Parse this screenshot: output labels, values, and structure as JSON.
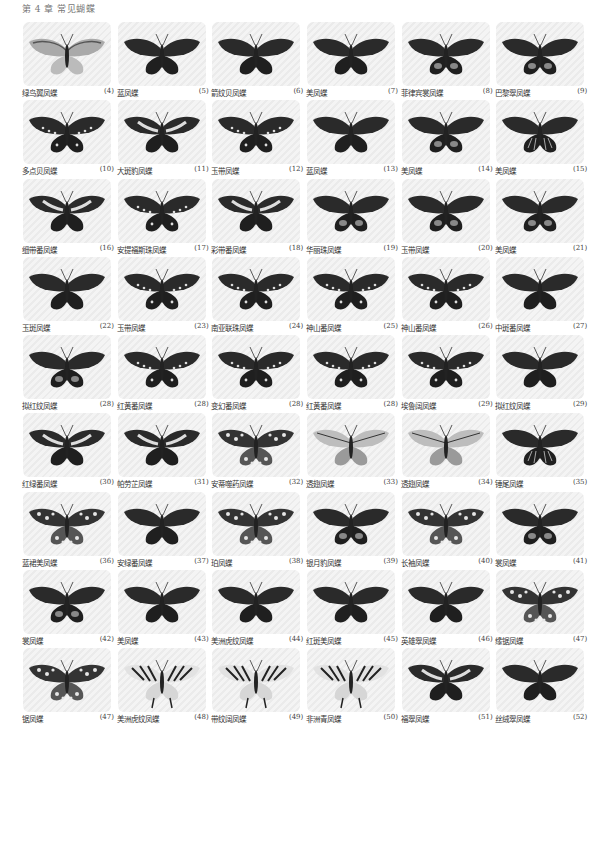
{
  "header": {
    "title": "第 4 章 常见蝴蝶"
  },
  "butterflies": [
    {
      "name": "绿鸟翼凤蝶",
      "num": "(4)",
      "style": "birdwing"
    },
    {
      "name": "蓝凤蝶",
      "num": "(5)",
      "style": "dark"
    },
    {
      "name": "箭纹贝凤蝶",
      "num": "(6)",
      "style": "dark"
    },
    {
      "name": "美凤蝶",
      "num": "(7)",
      "style": "dark"
    },
    {
      "name": "菲律宾裳凤蝶",
      "num": "(8)",
      "style": "darkspot"
    },
    {
      "name": "巴黎翠凤蝶",
      "num": "(9)",
      "style": "darkspot"
    },
    {
      "name": "多点贝凤蝶",
      "num": "(10)",
      "style": "dots"
    },
    {
      "name": "大斑豹凤蝶",
      "num": "(11)",
      "style": "band"
    },
    {
      "name": "玉带凤蝶",
      "num": "(12)",
      "style": "dots"
    },
    {
      "name": "蓝凤蝶",
      "num": "(13)",
      "style": "dark"
    },
    {
      "name": "美凤蝶",
      "num": "(14)",
      "style": "darkspot"
    },
    {
      "name": "美凤蝶",
      "num": "(15)",
      "style": "stripe"
    },
    {
      "name": "细带番凤蝶",
      "num": "(16)",
      "style": "band"
    },
    {
      "name": "安提福斯珠凤蝶",
      "num": "(17)",
      "style": "dots"
    },
    {
      "name": "彩带番凤蝶",
      "num": "(18)",
      "style": "band"
    },
    {
      "name": "华丽珠凤蝶",
      "num": "(19)",
      "style": "darkspot"
    },
    {
      "name": "玉带凤蝶",
      "num": "(20)",
      "style": "darkspot"
    },
    {
      "name": "美凤蝶",
      "num": "(21)",
      "style": "darkspot"
    },
    {
      "name": "玉斑凤蝶",
      "num": "(22)",
      "style": "dark"
    },
    {
      "name": "玉带凤蝶",
      "num": "(23)",
      "style": "dots"
    },
    {
      "name": "南亚联珠凤蝶",
      "num": "(24)",
      "style": "dots"
    },
    {
      "name": "神山番凤蝶",
      "num": "(25)",
      "style": "dots"
    },
    {
      "name": "神山番凤蝶",
      "num": "(26)",
      "style": "dots"
    },
    {
      "name": "中斑番凤蝶",
      "num": "(27)",
      "style": "dark"
    },
    {
      "name": "拟红纹凤蝶",
      "num": "(28)",
      "style": "darkspot"
    },
    {
      "name": "红黄番凤蝶",
      "num": "(28)",
      "style": "dots"
    },
    {
      "name": "变幻番凤蝶",
      "num": "(28)",
      "style": "dots"
    },
    {
      "name": "红黄番凤蝶",
      "num": "(28)",
      "style": "dots"
    },
    {
      "name": "埃鲁阔凤蝶",
      "num": "(29)",
      "style": "dots"
    },
    {
      "name": "拟红纹凤蝶",
      "num": "(29)",
      "style": "dark"
    },
    {
      "name": "红绿番凤蝶",
      "num": "(30)",
      "style": "band"
    },
    {
      "name": "帕劳芷凤蝶",
      "num": "(31)",
      "style": "band"
    },
    {
      "name": "安蒂噬药凤蝶",
      "num": "(32)",
      "style": "spotted"
    },
    {
      "name": "透翅凤蝶",
      "num": "(33)",
      "style": "light"
    },
    {
      "name": "透翅凤蝶",
      "num": "(34)",
      "style": "light"
    },
    {
      "name": "锤尾凤蝶",
      "num": "(35)",
      "style": "stripe"
    },
    {
      "name": "蓝裙美凤蝶",
      "num": "(36)",
      "style": "spotted"
    },
    {
      "name": "安绿番凤蝶",
      "num": "(37)",
      "style": "dark"
    },
    {
      "name": "珀凤蝶",
      "num": "(38)",
      "style": "spotted"
    },
    {
      "name": "银月豹凤蝶",
      "num": "(39)",
      "style": "darkspot"
    },
    {
      "name": "长袖凤蝶",
      "num": "(40)",
      "style": "spotted"
    },
    {
      "name": "裳凤蝶",
      "num": "(41)",
      "style": "darkspot"
    },
    {
      "name": "裳凤蝶",
      "num": "(42)",
      "style": "darkspot"
    },
    {
      "name": "美凤蝶",
      "num": "(43)",
      "style": "dark"
    },
    {
      "name": "美洲虎纹凤蝶",
      "num": "(44)",
      "style": "dark"
    },
    {
      "name": "红斑美凤蝶",
      "num": "(45)",
      "style": "dark"
    },
    {
      "name": "英雄翠凤蝶",
      "num": "(46)",
      "style": "dark"
    },
    {
      "name": "缘锯凤蝶",
      "num": "(47)",
      "style": "spotted"
    },
    {
      "name": "锯凤蝶",
      "num": "(47)",
      "style": "spotted"
    },
    {
      "name": "美洲虎纹凤蝶",
      "num": "(48)",
      "style": "tiger"
    },
    {
      "name": "带纹阔凤蝶",
      "num": "(49)",
      "style": "tiger"
    },
    {
      "name": "非洲青凤蝶",
      "num": "(50)",
      "style": "tiger"
    },
    {
      "name": "福翠凤蝶",
      "num": "(51)",
      "style": "band"
    },
    {
      "name": "丝绒翠凤蝶",
      "num": "(52)",
      "style": "dark"
    }
  ]
}
